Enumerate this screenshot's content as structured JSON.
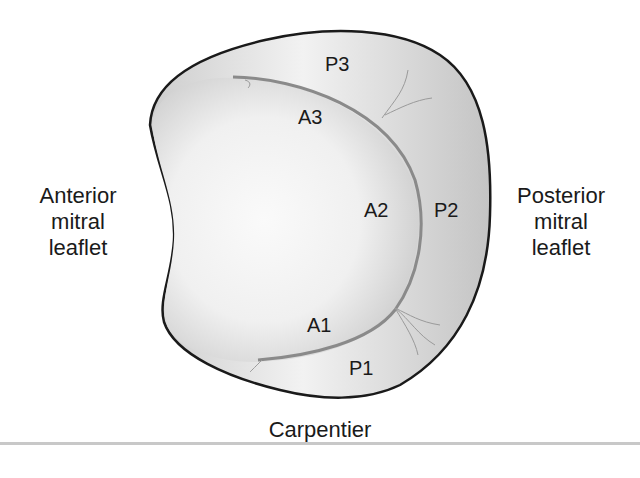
{
  "labels": {
    "anterior": [
      "Anterior",
      "mitral",
      "leaflet"
    ],
    "posterior": [
      "Posterior",
      "mitral",
      "leaflet"
    ],
    "caption": "Carpentier"
  },
  "segments": {
    "P3": "P3",
    "A3": "A3",
    "A2": "A2",
    "P2": "P2",
    "A1": "A1",
    "P1": "P1"
  },
  "colors": {
    "outline": "#1a1a1a",
    "fill_light": "#f4f4f4",
    "fill_mid": "#d8d8d8",
    "coaptation_line": "#8a8a8a",
    "rule": "#c8c8c8"
  }
}
